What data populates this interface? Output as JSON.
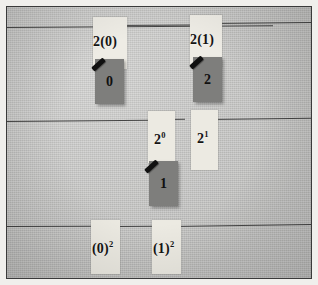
{
  "scene": {
    "kind": "photograph-of-board",
    "background_color": "#c9c9c7",
    "frame_color": "#3a3a3a",
    "mat_color": "#f0efec",
    "strip_color": "#eceae2",
    "card_color": "#7e7e7c",
    "ink_color": "#141414",
    "ledge_color": "#2e2e2e"
  },
  "rows": [
    {
      "name": "multiplication-row",
      "labels": [
        {
          "id": "label-2-times-0",
          "base": "2(0)",
          "exponent": ""
        },
        {
          "id": "label-2-times-1",
          "base": "2(1)",
          "exponent": ""
        }
      ],
      "cards": [
        {
          "id": "card-0",
          "value": "0"
        },
        {
          "id": "card-2",
          "value": "2"
        }
      ]
    },
    {
      "name": "exponent-row",
      "labels": [
        {
          "id": "label-2-pow-0",
          "base": "2",
          "exponent": "0"
        },
        {
          "id": "label-2-pow-1",
          "base": "2",
          "exponent": "1"
        }
      ],
      "cards": [
        {
          "id": "card-1",
          "value": "1"
        }
      ]
    },
    {
      "name": "square-row",
      "labels": [
        {
          "id": "label-0-squared",
          "base": "(0)",
          "exponent": "2"
        },
        {
          "id": "label-1-squared",
          "base": "(1)",
          "exponent": "2"
        }
      ],
      "cards": []
    }
  ],
  "labels": {
    "two_times_zero": "2(0)",
    "two_times_one": "2(1)",
    "two_pow_base": "2",
    "two_pow_zero_exp": "0",
    "two_pow_one_exp": "1",
    "zero_squared_base": "(0)",
    "zero_squared_exp": "2",
    "one_squared_base": "(1)",
    "one_squared_exp": "2"
  },
  "values": {
    "two_times_zero_result": "0",
    "two_times_one_result": "2",
    "two_pow_zero_result": "1"
  }
}
